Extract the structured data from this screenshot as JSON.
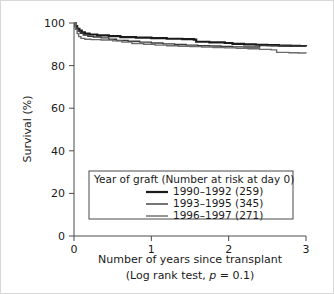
{
  "chart_data": {
    "type": "line",
    "title": "",
    "xlabel": "Number of years since transplant",
    "xlabel_line2": "(Log rank test, p = 0.1)",
    "ylabel": "Survival (%)",
    "xlim": [
      0,
      3
    ],
    "ylim": [
      0,
      100
    ],
    "xticks": [
      "0",
      "1",
      "2",
      "3"
    ],
    "xtick_values": [
      0,
      1,
      2,
      3
    ],
    "yticks": [
      "0",
      "20",
      "40",
      "60",
      "80",
      "100"
    ],
    "ytick_values": [
      0,
      20,
      40,
      60,
      80,
      100
    ],
    "grid": false,
    "legend_position": "inside-lower-center",
    "legend_title": "Year of graft (Number at risk at day 0)",
    "statistic": "Log rank test",
    "p_value": "0.1",
    "series": [
      {
        "name": "1990–1992 (259)",
        "label": "1990–1992 (259)",
        "group": "1990–1992",
        "n_at_risk": 259,
        "color": "#1a1a1a",
        "width": 2.2,
        "points": [
          [
            0.0,
            100.0
          ],
          [
            0.02,
            98.5
          ],
          [
            0.04,
            97.2
          ],
          [
            0.07,
            96.4
          ],
          [
            0.1,
            95.6
          ],
          [
            0.14,
            95.0
          ],
          [
            0.2,
            94.6
          ],
          [
            0.3,
            94.2
          ],
          [
            0.45,
            93.8
          ],
          [
            0.6,
            93.4
          ],
          [
            0.8,
            93.1
          ],
          [
            1.0,
            92.9
          ],
          [
            1.2,
            92.6
          ],
          [
            1.4,
            92.4
          ],
          [
            1.55,
            92.2
          ],
          [
            1.58,
            91.2
          ],
          [
            1.75,
            90.9
          ],
          [
            1.95,
            90.6
          ],
          [
            2.05,
            90.2
          ],
          [
            2.2,
            90.0
          ],
          [
            2.35,
            89.8
          ],
          [
            2.5,
            89.6
          ],
          [
            2.65,
            89.4
          ],
          [
            2.8,
            89.3
          ],
          [
            2.92,
            89.2
          ],
          [
            3.0,
            89.1
          ]
        ]
      },
      {
        "name": "1993–1995 (345)",
        "label": "1993–1995 (345)",
        "group": "1993–1995",
        "n_at_risk": 345,
        "color": "#3a3a3a",
        "width": 1.4,
        "points": [
          [
            0.0,
            100.0
          ],
          [
            0.02,
            97.8
          ],
          [
            0.05,
            96.2
          ],
          [
            0.08,
            95.2
          ],
          [
            0.12,
            94.4
          ],
          [
            0.18,
            93.8
          ],
          [
            0.25,
            93.4
          ],
          [
            0.35,
            93.0
          ],
          [
            0.45,
            92.4
          ],
          [
            0.55,
            91.8
          ],
          [
            0.7,
            91.4
          ],
          [
            0.85,
            91.0
          ],
          [
            1.0,
            90.6
          ],
          [
            1.15,
            90.2
          ],
          [
            1.3,
            89.9
          ],
          [
            1.45,
            89.6
          ],
          [
            1.6,
            89.4
          ],
          [
            1.75,
            89.2
          ],
          [
            1.9,
            89.0
          ],
          [
            2.05,
            88.8
          ],
          [
            2.2,
            88.7
          ],
          [
            2.4,
            89.4
          ],
          [
            2.55,
            89.3
          ],
          [
            2.7,
            89.2
          ],
          [
            2.85,
            89.1
          ],
          [
            3.0,
            89.0
          ]
        ]
      },
      {
        "name": "1996–1997 (271)",
        "label": "1996–1997 (271)",
        "group": "1996–1997",
        "n_at_risk": 271,
        "color": "#6b6b6b",
        "width": 1.4,
        "points": [
          [
            0.0,
            100.0
          ],
          [
            0.02,
            97.0
          ],
          [
            0.04,
            95.0
          ],
          [
            0.06,
            93.6
          ],
          [
            0.09,
            92.8
          ],
          [
            0.14,
            92.4
          ],
          [
            0.22,
            92.2
          ],
          [
            0.35,
            92.0
          ],
          [
            0.5,
            91.6
          ],
          [
            0.62,
            91.0
          ],
          [
            0.75,
            90.4
          ],
          [
            0.9,
            90.0
          ],
          [
            1.05,
            89.6
          ],
          [
            1.2,
            89.3
          ],
          [
            1.35,
            89.1
          ],
          [
            1.5,
            88.9
          ],
          [
            1.65,
            88.7
          ],
          [
            1.8,
            88.5
          ],
          [
            1.95,
            88.3
          ],
          [
            2.1,
            88.1
          ],
          [
            2.25,
            87.9
          ],
          [
            2.4,
            87.6
          ],
          [
            2.55,
            87.4
          ],
          [
            2.62,
            86.2
          ],
          [
            2.78,
            86.0
          ],
          [
            2.9,
            85.9
          ],
          [
            3.0,
            85.8
          ]
        ]
      }
    ]
  },
  "axes": {
    "y_axis_label": "Survival (%)",
    "x_axis_label": "Number of years since transplant",
    "x_axis_caption_prefix": "(Log rank test, ",
    "x_axis_caption_p": "p",
    "x_axis_caption_suffix": " = 0.1)"
  },
  "legend": {
    "title": "Year of graft (Number at risk at day 0)",
    "entries": [
      {
        "label": "1990–1992 (259)"
      },
      {
        "label": "1993–1995 (345)"
      },
      {
        "label": "1996–1997 (271)"
      }
    ]
  },
  "colors": {
    "series_1": "#1a1a1a",
    "series_2": "#3a3a3a",
    "series_3": "#6b6b6b",
    "axis": "#4a4a4a",
    "text": "#1a1a1a",
    "frame": "#d8d8d8",
    "background": "#ffffff"
  }
}
